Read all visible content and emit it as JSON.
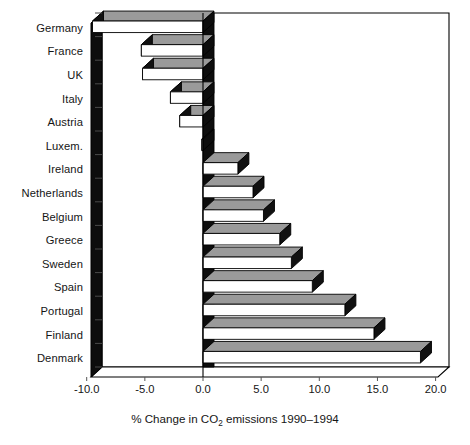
{
  "chart_data": {
    "type": "bar",
    "orientation": "horizontal",
    "title": "",
    "xlabel": "% Change in CO2 emissions 1990–1994",
    "ylabel": "",
    "categories": [
      "Germany",
      "France",
      "UK",
      "Italy",
      "Austria",
      "Luxem.",
      "Ireland",
      "Netherlands",
      "Belgium",
      "Greece",
      "Sweden",
      "Spain",
      "Portugal",
      "Finland",
      "Denmark"
    ],
    "values": [
      -9.5,
      -5.3,
      -5.2,
      -2.8,
      -2.0,
      -0.1,
      3.0,
      4.3,
      5.2,
      6.6,
      7.6,
      9.4,
      12.2,
      14.7,
      18.7
    ],
    "xlim": [
      -10.0,
      20.0
    ],
    "xticks": [
      -10.0,
      -5.0,
      0.0,
      5.0,
      10.0,
      15.0,
      20.0
    ],
    "xtick_labels": [
      "-10.0",
      "-5.0",
      "0.0",
      "5.0",
      "10.0",
      "15.0",
      "20.0"
    ],
    "grid": false,
    "legend": null,
    "style": "3d-extruded-horizontal-bars",
    "bar_face_color": "#ffffff",
    "bar_top_color": "#9a9a9a",
    "bar_side_color": "#111111",
    "bar_edge_color": "#000000",
    "axis_color": "#000000"
  },
  "axis_title": {
    "prefix": "% Change in CO",
    "subscript": "2",
    "suffix": " emissions 1990–1994"
  }
}
